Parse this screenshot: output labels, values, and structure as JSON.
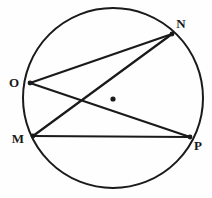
{
  "figure": {
    "background_color": "#fefefe",
    "stroke_color": "#1a1a1a",
    "label_color": "#1a1a1a",
    "width": 212,
    "height": 198
  },
  "circle": {
    "name": "circle-outline",
    "center_x": 113,
    "center_y": 98,
    "radius": 90,
    "stroke_width": 2.0,
    "fill": "none"
  },
  "center_marker": {
    "name": "center-point",
    "x": 113,
    "y": 99,
    "radius": 2.6,
    "fill": "#1a1a1a"
  },
  "points": [
    {
      "id": "M",
      "label": "M",
      "x": 33,
      "y": 136,
      "label_x": 18,
      "label_y": 138,
      "dot_radius": 2.4
    },
    {
      "id": "N",
      "label": "N",
      "x": 172,
      "y": 34,
      "label_x": 181,
      "label_y": 23,
      "dot_radius": 2.4
    },
    {
      "id": "O",
      "label": "O",
      "x": 30,
      "y": 83,
      "label_x": 14,
      "label_y": 82,
      "dot_radius": 2.4
    },
    {
      "id": "P",
      "label": "P",
      "x": 190,
      "y": 137,
      "label_x": 198,
      "label_y": 145,
      "dot_radius": 2.4
    }
  ],
  "chords": [
    {
      "id": "ON",
      "name": "chord-O-N",
      "from": "O",
      "to": "N",
      "x1": 30,
      "y1": 83,
      "x2": 172,
      "y2": 34,
      "stroke_width": 2.2
    },
    {
      "id": "OP",
      "name": "chord-O-P",
      "from": "O",
      "to": "P",
      "x1": 30,
      "y1": 83,
      "x2": 190,
      "y2": 137,
      "stroke_width": 2.2
    },
    {
      "id": "MN",
      "name": "chord-M-N",
      "from": "M",
      "to": "N",
      "x1": 33,
      "y1": 136,
      "x2": 172,
      "y2": 34,
      "stroke_width": 2.2
    },
    {
      "id": "MP",
      "name": "chord-M-P",
      "from": "M",
      "to": "P",
      "x1": 33,
      "y1": 136,
      "x2": 190,
      "y2": 137,
      "stroke_width": 2.2
    }
  ]
}
